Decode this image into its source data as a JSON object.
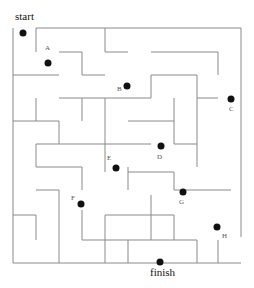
{
  "title_start": "start",
  "title_finish": "finish",
  "colors": {
    "wall": "#8a8a8a",
    "dot": "#111111",
    "background": "#ffffff"
  },
  "walls": [
    [
      36,
      28,
      241,
      28
    ],
    [
      13,
      28,
      13,
      263
    ],
    [
      241,
      28,
      241,
      237
    ],
    [
      13,
      263,
      241,
      263
    ],
    [
      36,
      28,
      36,
      52
    ],
    [
      59,
      52,
      82,
      52
    ],
    [
      82,
      52,
      82,
      75
    ],
    [
      82,
      75,
      105,
      75
    ],
    [
      105,
      28,
      105,
      52
    ],
    [
      105,
      52,
      128,
      52
    ],
    [
      13,
      75,
      59,
      75
    ],
    [
      59,
      98,
      151,
      98
    ],
    [
      82,
      98,
      82,
      121
    ],
    [
      105,
      98,
      105,
      121
    ],
    [
      13,
      121,
      59,
      121
    ],
    [
      36,
      98,
      36,
      121
    ],
    [
      59,
      121,
      59,
      144
    ],
    [
      59,
      144,
      151,
      144
    ],
    [
      105,
      121,
      105,
      172
    ],
    [
      151,
      52,
      218,
      52
    ],
    [
      218,
      52,
      218,
      75
    ],
    [
      151,
      75,
      197,
      75
    ],
    [
      151,
      75,
      151,
      98
    ],
    [
      197,
      75,
      197,
      121
    ],
    [
      197,
      98,
      218,
      98
    ],
    [
      174,
      98,
      174,
      144
    ],
    [
      128,
      121,
      174,
      121
    ],
    [
      174,
      144,
      197,
      144
    ],
    [
      128,
      167,
      128,
      190
    ],
    [
      197,
      121,
      197,
      167
    ],
    [
      36,
      144,
      36,
      167
    ],
    [
      36,
      167,
      59,
      167
    ],
    [
      36,
      144,
      59,
      144
    ],
    [
      59,
      167,
      82,
      167
    ],
    [
      82,
      167,
      82,
      190
    ],
    [
      36,
      190,
      59,
      190
    ],
    [
      59,
      190,
      59,
      263
    ],
    [
      13,
      215,
      36,
      215
    ],
    [
      36,
      215,
      36,
      240
    ],
    [
      128,
      172,
      174,
      172
    ],
    [
      174,
      172,
      174,
      190
    ],
    [
      174,
      190,
      231,
      190
    ],
    [
      82,
      210,
      82,
      240
    ],
    [
      82,
      240,
      151,
      240
    ],
    [
      151,
      195,
      151,
      240
    ],
    [
      105,
      215,
      174,
      215
    ],
    [
      105,
      215,
      105,
      263
    ],
    [
      174,
      215,
      174,
      240
    ],
    [
      128,
      240,
      128,
      263
    ],
    [
      151,
      240,
      197,
      240
    ],
    [
      197,
      240,
      197,
      263
    ],
    [
      218,
      240,
      218,
      263
    ]
  ],
  "points": [
    {
      "id": "start-dot",
      "x": 23,
      "y": 33,
      "label": ""
    },
    {
      "id": "A",
      "x": 48,
      "y": 63,
      "label": "A"
    },
    {
      "id": "B",
      "x": 127,
      "y": 86,
      "label": "B"
    },
    {
      "id": "C",
      "x": 231,
      "y": 99,
      "label": "C"
    },
    {
      "id": "D",
      "x": 161,
      "y": 146,
      "label": "D"
    },
    {
      "id": "E",
      "x": 116,
      "y": 168,
      "label": "E"
    },
    {
      "id": "F",
      "x": 81,
      "y": 204,
      "label": "F"
    },
    {
      "id": "G",
      "x": 183,
      "y": 192,
      "label": "G"
    },
    {
      "id": "H",
      "x": 217,
      "y": 227,
      "label": "H"
    },
    {
      "id": "finish-dot",
      "x": 160,
      "y": 262,
      "label": ""
    }
  ],
  "labels": [
    {
      "text": "A",
      "x": 45,
      "y": 44
    },
    {
      "text": "B",
      "x": 117,
      "y": 85
    },
    {
      "text": "C",
      "x": 229,
      "y": 105
    },
    {
      "text": "D",
      "x": 157,
      "y": 153
    },
    {
      "text": "E",
      "x": 107,
      "y": 154
    },
    {
      "text": "F",
      "x": 71,
      "y": 194
    },
    {
      "text": "G",
      "x": 179,
      "y": 198
    },
    {
      "text": "H",
      "x": 222,
      "y": 232
    }
  ]
}
